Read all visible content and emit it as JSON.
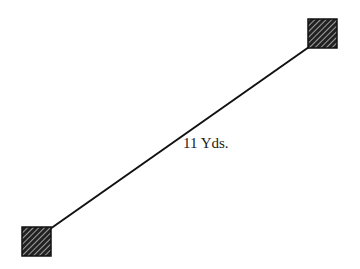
{
  "diagram": {
    "distance_label": "11 Yds.",
    "markers": [
      {
        "name": "start-marker",
        "x": 22,
        "y": 227,
        "size": 29
      },
      {
        "name": "end-marker",
        "x": 308,
        "y": 19,
        "size": 29
      }
    ],
    "line": {
      "x1": 50,
      "y1": 229,
      "x2": 309,
      "y2": 47
    },
    "colors": {
      "line": "#111111",
      "marker_fill": "#222222",
      "marker_hatch": "#bbbbbb"
    }
  }
}
